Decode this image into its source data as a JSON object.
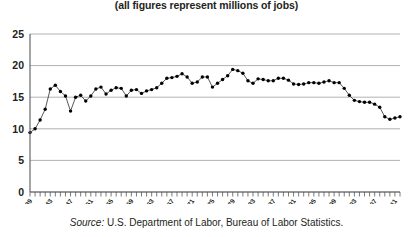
{
  "subtitle": "(all figures represent millions of jobs)",
  "source": {
    "label": "Source:",
    "text": " U.S. Department of Labor, Bureau of Labor Statistics."
  },
  "colors": {
    "line": "#231f20",
    "grid": "#a7a9ac",
    "axis": "#58595b",
    "text": "#231f20"
  },
  "chart_data": {
    "type": "line",
    "title": "",
    "subtitle": "(all figures represent millions of jobs)",
    "xlabel": "",
    "ylabel": "",
    "ylim": [
      0,
      25
    ],
    "yticks": [
      0,
      5,
      10,
      15,
      20,
      25
    ],
    "xlim": [
      1939,
      2012
    ],
    "xtick_labels": [
      "1939",
      "1943",
      "1947",
      "1951",
      "1955",
      "1959",
      "1963",
      "1967",
      "1971",
      "1975",
      "1979",
      "1983",
      "1987",
      "1991",
      "1995",
      "1999",
      "2003",
      "2007",
      "2011"
    ],
    "xtick_interval": 4,
    "grid": true,
    "legend": false,
    "markers": true,
    "series": [
      {
        "name": "Manufacturing employment",
        "x": [
          1939,
          1940,
          1941,
          1942,
          1943,
          1944,
          1945,
          1946,
          1947,
          1948,
          1949,
          1950,
          1951,
          1952,
          1953,
          1954,
          1955,
          1956,
          1957,
          1958,
          1959,
          1960,
          1961,
          1962,
          1963,
          1964,
          1965,
          1966,
          1967,
          1968,
          1969,
          1970,
          1971,
          1972,
          1973,
          1974,
          1975,
          1976,
          1977,
          1978,
          1979,
          1980,
          1981,
          1982,
          1983,
          1984,
          1985,
          1986,
          1987,
          1988,
          1989,
          1990,
          1991,
          1992,
          1993,
          1994,
          1995,
          1996,
          1997,
          1998,
          1999,
          2000,
          2001,
          2002,
          2003,
          2004,
          2005,
          2006,
          2007,
          2008,
          2009,
          2010,
          2011,
          2012
        ],
        "values": [
          9.4,
          10.0,
          11.4,
          13.1,
          16.3,
          16.9,
          15.9,
          15.2,
          12.8,
          15.0,
          15.3,
          14.4,
          15.2,
          16.3,
          16.6,
          15.5,
          16.1,
          16.5,
          16.4,
          15.2,
          16.1,
          16.2,
          15.6,
          16.0,
          16.2,
          16.5,
          17.2,
          18.0,
          18.1,
          18.3,
          18.7,
          18.2,
          17.2,
          17.4,
          18.2,
          18.2,
          16.6,
          17.2,
          17.8,
          18.4,
          19.4,
          19.2,
          18.8,
          17.6,
          17.2,
          17.9,
          17.8,
          17.6,
          17.6,
          18.0,
          18.0,
          17.7,
          17.1,
          17.0,
          17.1,
          17.3,
          17.3,
          17.2,
          17.4,
          17.6,
          17.3,
          17.3,
          16.4,
          15.3,
          14.5,
          14.3,
          14.2,
          14.2,
          13.9,
          13.4,
          11.9,
          11.5,
          11.7,
          11.9
        ]
      }
    ]
  }
}
